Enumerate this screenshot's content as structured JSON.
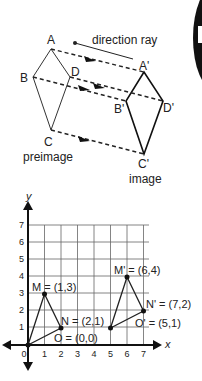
{
  "top_diagram": {
    "title": "direction ray",
    "preimage_label": "preimage",
    "image_label": "image",
    "vertices": {
      "A": "A",
      "B": "B",
      "C": "C",
      "D": "D",
      "A2": "A'",
      "B2": "B'",
      "C2": "C'",
      "D2": "D'"
    }
  },
  "graph": {
    "x_label": "x",
    "y_label": "y",
    "x_ticks": [
      "0",
      "1",
      "2",
      "3",
      "4",
      "5",
      "6",
      "7"
    ],
    "y_ticks": [
      "1",
      "2",
      "3",
      "4",
      "5",
      "6",
      "7"
    ],
    "points": {
      "M": "M = (1,3)",
      "N": "N = (2,1)",
      "O": "O = (0,0)",
      "M2": "M' = (6,4)",
      "N2": "N' = (7,2)",
      "O2": "O' = (5,1)"
    }
  }
}
